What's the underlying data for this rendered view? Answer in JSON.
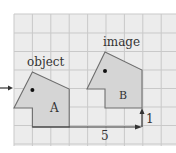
{
  "diagram": {
    "type": "translation",
    "grid": {
      "x0": 14,
      "y0": 14,
      "cell": 18.4,
      "cols": 9,
      "rows": 7,
      "background": "#ececec",
      "line_color": "#c9c9c9"
    },
    "labels": {
      "object": "object",
      "image": "image",
      "shape_a": "A",
      "shape_b": "B",
      "horizontal_shift": "5",
      "vertical_shift": "1"
    },
    "colors": {
      "shape_fill": "#d5d5d5",
      "shape_stroke": "#6e6e6e",
      "arrow": "#333333"
    },
    "translation_vector": {
      "dx": 5,
      "dy": 1
    }
  }
}
